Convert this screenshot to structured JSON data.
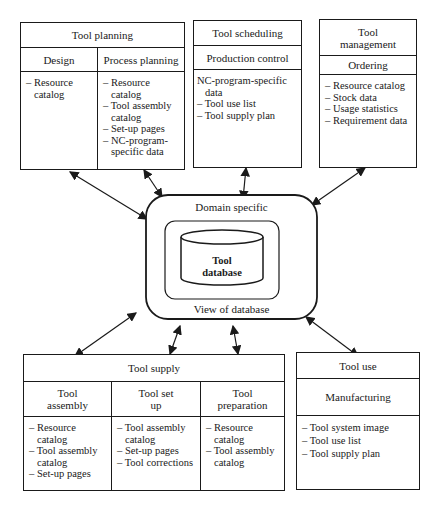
{
  "tool_planning": {
    "title": "Tool planning",
    "columns": [
      {
        "header": "Design",
        "items": [
          "– Resource catalog"
        ]
      },
      {
        "header": "Process planning",
        "items": [
          "– Resource catalog",
          "– Tool assembly catalog",
          "– Set-up pages",
          "– NC-program-specific data"
        ]
      }
    ]
  },
  "tool_scheduling": {
    "title": "Tool scheduling",
    "subheader": "Production control",
    "items": [
      "NC-program-specific data",
      "– Tool use list",
      "– Tool supply plan"
    ]
  },
  "tool_management": {
    "title": "Tool management",
    "subheader": "Ordering",
    "items": [
      "– Resource catalog",
      "– Stock data",
      "– Usage statistics",
      "– Requirement data"
    ]
  },
  "center": {
    "outer_top_label": "Domain specific",
    "outer_bottom_label": "View of database",
    "database_label_1": "Tool",
    "database_label_2": "database"
  },
  "tool_supply": {
    "title": "Tool supply",
    "columns": [
      {
        "header": "Tool assembly",
        "items": [
          "– Resource catalog",
          "– Tool assembly catalog",
          "– Set-up pages"
        ]
      },
      {
        "header": "Tool set up",
        "items": [
          "– Tool assembly catalog",
          "– Set-up pages",
          "– Tool corrections"
        ]
      },
      {
        "header": "Tool preparation",
        "items": [
          "– Resource catalog",
          "– Tool assembly catalog"
        ]
      }
    ]
  },
  "tool_use": {
    "title": "Tool use",
    "subheader": "Manufacturing",
    "items": [
      "– Tool system image",
      "– Tool use list",
      "– Tool supply plan"
    ]
  }
}
